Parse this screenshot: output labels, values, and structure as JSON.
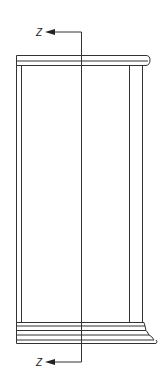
{
  "diagram": {
    "type": "section elevation",
    "section_marks": {
      "top": {
        "label": "Z"
      },
      "bottom": {
        "label": "Z"
      }
    },
    "line_color": "#333333",
    "background": "#ffffff"
  }
}
